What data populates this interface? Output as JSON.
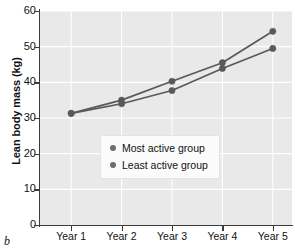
{
  "panel": {
    "letter": "b"
  },
  "chart_data": {
    "type": "line",
    "title": "",
    "xlabel": "",
    "ylabel": "Lean body mass (kg)",
    "categories": [
      "Year 1",
      "Year 2",
      "Year 3",
      "Year 4",
      "Year 5"
    ],
    "series": [
      {
        "name": "Most active group",
        "values": [
          31.3,
          35.0,
          40.3,
          45.5,
          54.3
        ],
        "color": "#595959",
        "marker": "circle"
      },
      {
        "name": "Least active group",
        "values": [
          31.3,
          34.0,
          37.7,
          43.9,
          49.5
        ],
        "color": "#595959",
        "marker": "circle"
      }
    ],
    "ylim": [
      0,
      60
    ],
    "yticks": [
      0,
      10,
      20,
      30,
      40,
      50,
      60
    ],
    "ytick_labels": [
      "0",
      "10",
      "20",
      "30",
      "40",
      "50",
      "60"
    ],
    "grid": true,
    "grid_color": "#ffffff",
    "plot_background": "#e9e9e9",
    "legend_position": "center",
    "legend": [
      {
        "label": "Most active group",
        "marker_color": "#6e6e6e"
      },
      {
        "label": "Least active group",
        "marker_color": "#6e6e6e"
      }
    ]
  }
}
